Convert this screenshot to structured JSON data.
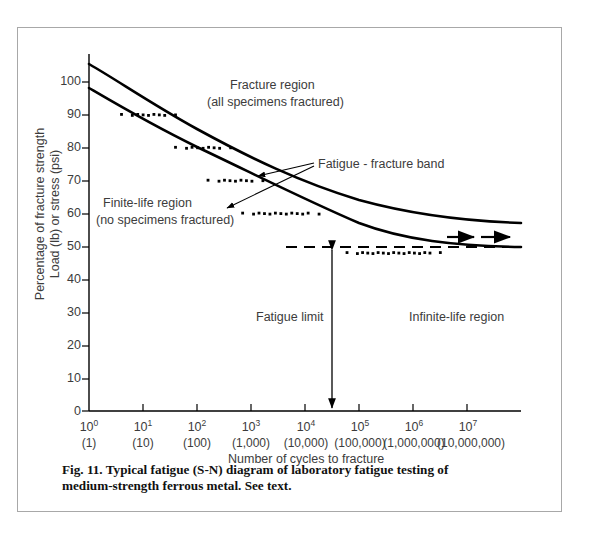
{
  "figure": {
    "caption_line1": "Fig. 11.  Typical fatigue (S-N) diagram of laboratory fatigue testing of",
    "caption_line2": "medium-strength ferrous metal. See text."
  },
  "chart_data": {
    "type": "line",
    "title": "Typical fatigue (S-N) diagram",
    "xlabel": "Number of cycles to fracture",
    "ylabel_line1": "Percentage of fracture strength",
    "ylabel_line2": "Load (lb) or stress (psi)",
    "xscale": "log",
    "xlim": [
      1,
      100000000
    ],
    "ylim": [
      0,
      108
    ],
    "grid": false,
    "legend": "none",
    "y_ticks": [
      0,
      10,
      20,
      30,
      40,
      50,
      60,
      70,
      80,
      90,
      100
    ],
    "x_ticks_exponent": [
      "10<sup>0</sup>",
      "10<sup>1</sup>",
      "10<sup>2</sup>",
      "10<sup>3</sup>",
      "10<sup>4</sup>",
      "10<sup>5</sup>",
      "10<sup>6</sup>",
      "10<sup>7</sup>"
    ],
    "x_ticks_plain": [
      "(1)",
      "(10)",
      "(100)",
      "(1,000)",
      "(10,000)",
      "(100,000)",
      "(1,000,000)",
      "(10,000,000)"
    ],
    "series": [
      {
        "name": "upper-bound-curve",
        "comment": "upper boundary of fatigue-fracture band",
        "x": [
          1,
          3.16,
          10,
          31.6,
          100,
          316,
          1000,
          3160,
          10000,
          31600,
          100000,
          316000,
          1000000,
          10000000,
          100000000
        ],
        "values": [
          105,
          100.5,
          95.5,
          90.5,
          85.5,
          80.5,
          75.5,
          71,
          67,
          63.5,
          60.5,
          58.5,
          57.3,
          56.3,
          56
        ]
      },
      {
        "name": "lower-bound-curve",
        "comment": "lower boundary of fatigue-fracture band",
        "x": [
          1,
          3.16,
          10,
          31.6,
          100,
          316,
          1000,
          3160,
          10000,
          31600,
          100000,
          316000,
          1000000,
          10000000,
          100000000
        ],
        "values": [
          97,
          92.5,
          88,
          83,
          78,
          72.5,
          67,
          62,
          57.5,
          53.5,
          50.2,
          48.5,
          48,
          47.6,
          47.5
        ]
      }
    ],
    "fatigue_limit_value": 47.5,
    "scatter_rows": [
      {
        "stress": 90,
        "x_from": 4,
        "x_to": 40
      },
      {
        "stress": 80,
        "x_from": 40,
        "x_to": 420
      },
      {
        "stress": 70,
        "x_from": 160,
        "x_to": 2100
      },
      {
        "stress": 60,
        "x_from": 700,
        "x_to": 23000
      },
      {
        "stress": 48,
        "x_from": 60000,
        "x_to": 4000000
      }
    ],
    "annotations": [
      {
        "name": "fracture-region",
        "line1": "Fracture region",
        "line2": "(all specimens fractured)"
      },
      {
        "name": "finite-life-region",
        "line1": "Finite-life region",
        "line2": "(no specimens fractured)"
      },
      {
        "name": "fatigue-fracture-band",
        "text": "Fatigue - fracture band"
      },
      {
        "name": "fatigue-limit",
        "text": "Fatigue limit"
      },
      {
        "name": "infinite-life-region",
        "text": "Infinite-life region"
      }
    ]
  },
  "colors": {
    "curve": "#000000",
    "axis": "#000000",
    "text": "#3c3c3c",
    "frame": "#a8a8a8",
    "caption": "#111111"
  }
}
